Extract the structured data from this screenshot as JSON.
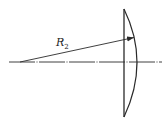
{
  "diagram": {
    "type": "plano-convex lens radius of curvature",
    "labels": {
      "radius": {
        "base": "R",
        "subscript": "2"
      }
    },
    "colors": {
      "stroke": "#2a2a2a",
      "background": "#ffffff"
    }
  }
}
